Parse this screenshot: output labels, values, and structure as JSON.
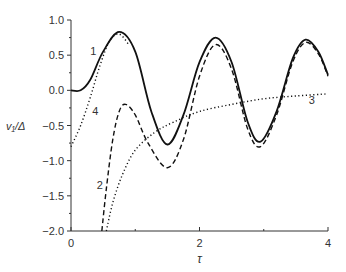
{
  "chart_data": {
    "type": "line",
    "title": "",
    "xlabel": "τ",
    "ylabel": "v₁/Δ",
    "xlim": [
      0,
      4
    ],
    "ylim": [
      -2.0,
      1.0
    ],
    "xticks": [
      "0",
      "2",
      "4"
    ],
    "yticks": [
      "1.0",
      "0.5",
      "0.0",
      "−0.5",
      "−1.0",
      "−1.5",
      "−2.0"
    ],
    "grid": false,
    "series": [
      {
        "name": "1",
        "style": "solid",
        "x": [
          0,
          0.15,
          0.3,
          0.5,
          0.75,
          1.0,
          1.25,
          1.5,
          1.75,
          2.0,
          2.25,
          2.5,
          2.75,
          2.95,
          3.2,
          3.45,
          3.65,
          3.85,
          4.0
        ],
        "y": [
          0,
          0.0,
          0.15,
          0.55,
          0.83,
          0.55,
          -0.3,
          -0.77,
          -0.35,
          0.4,
          0.75,
          0.4,
          -0.45,
          -0.73,
          -0.3,
          0.45,
          0.72,
          0.55,
          0.22
        ]
      },
      {
        "name": "2",
        "style": "dashed",
        "x": [
          0.48,
          0.55,
          0.65,
          0.75,
          0.85,
          1.0,
          1.2,
          1.5,
          1.75,
          2.0,
          2.25,
          2.5,
          2.75,
          2.95,
          3.2,
          3.45,
          3.65,
          3.85,
          4.0
        ],
        "y": [
          -2.0,
          -1.4,
          -0.7,
          -0.3,
          -0.2,
          -0.35,
          -0.75,
          -1.1,
          -0.7,
          0.2,
          0.65,
          0.3,
          -0.55,
          -0.8,
          -0.35,
          0.4,
          0.68,
          0.52,
          0.2
        ]
      },
      {
        "name": "3",
        "style": "dotted",
        "x": [
          0.55,
          0.65,
          0.8,
          1.0,
          1.3,
          1.6,
          2.0,
          2.5,
          3.0,
          3.5,
          4.0
        ],
        "y": [
          -2.0,
          -1.6,
          -1.2,
          -0.85,
          -0.6,
          -0.45,
          -0.3,
          -0.2,
          -0.12,
          -0.08,
          -0.05
        ]
      },
      {
        "name": "4",
        "style": "dotted",
        "x": [
          0,
          0.15,
          0.3,
          0.45,
          0.6,
          0.75,
          0.9
        ],
        "y": [
          -0.8,
          -0.5,
          -0.1,
          0.35,
          0.7,
          0.8,
          0.65
        ]
      }
    ],
    "annotations": [
      {
        "text": "1",
        "x": 0.3,
        "y": 0.5
      },
      {
        "text": "2",
        "x": 0.4,
        "y": -1.4
      },
      {
        "text": "3",
        "x": 3.7,
        "y": -0.2
      },
      {
        "text": "4",
        "x": 0.33,
        "y": -0.35
      }
    ]
  }
}
